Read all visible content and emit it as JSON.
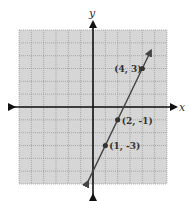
{
  "chart_data": {
    "type": "line",
    "title": "",
    "xlabel": "x",
    "ylabel": "y",
    "xlim": [
      -6,
      6
    ],
    "ylim": [
      -6,
      6
    ],
    "grid": true,
    "grid_step": 1,
    "line": {
      "equation": "y = 2x - 5",
      "slope": 2,
      "intercept": -5,
      "x_range": [
        -0.4,
        4.7
      ],
      "arrows": "both"
    },
    "points": [
      {
        "x": 4,
        "y": 3,
        "label": "(4, 3)"
      },
      {
        "x": 2,
        "y": -1,
        "label": "(2, -1)"
      },
      {
        "x": 1,
        "y": -3,
        "label": "(1, -3)"
      }
    ]
  },
  "colors": {
    "grid_bg": "#d6d6d6",
    "grid_line": "#9a9a9a",
    "axis": "#111111",
    "line": "#444444",
    "point": "#333333"
  }
}
